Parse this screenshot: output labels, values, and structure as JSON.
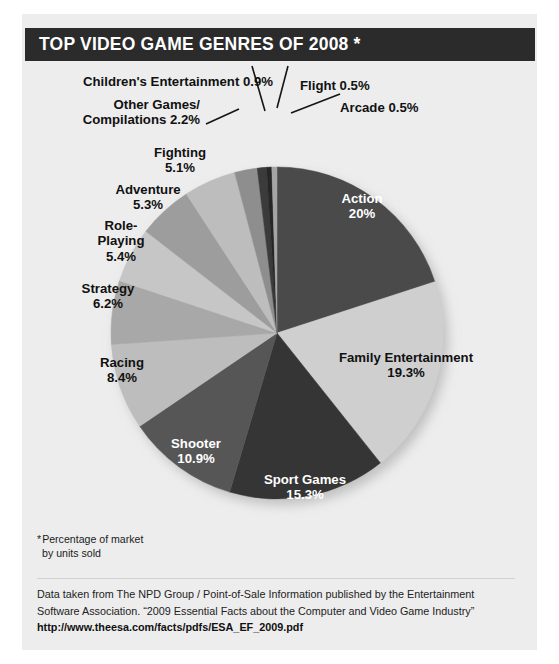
{
  "header": {
    "title": "TOP VIDEO GAME GENRES OF 2008 *"
  },
  "footnote": {
    "marker": "*",
    "line1": "Percentage of market",
    "line2": "by units sold"
  },
  "source": {
    "line1": "Data taken from The NPD Group / Point-of-Sale Information published by the Entertainment",
    "line2": "Software Association. “2009 Essential Facts about the Computer and Video Game Industry”",
    "url": "http://www.theesa.com/facts/pdfs/ESA_EF_2009.pdf"
  },
  "chart_data": {
    "type": "pie",
    "title": "TOP VIDEO GAME GENRES OF 2008 *",
    "unit": "percent of market by units sold",
    "categories": [
      "Action",
      "Family Entertainment",
      "Sport Games",
      "Shooter",
      "Racing",
      "Strategy",
      "Role-Playing",
      "Adventure",
      "Fighting",
      "Other Games/Compilations",
      "Children's Entertainment",
      "Flight",
      "Arcade"
    ],
    "values": [
      20,
      19.3,
      15.3,
      10.9,
      8.4,
      6.2,
      5.4,
      5.3,
      5.1,
      2.2,
      0.9,
      0.5,
      0.5
    ],
    "slices": [
      {
        "id": "action",
        "label": "Action",
        "value_text": "20%",
        "value": 20,
        "color": "#4a4a4a",
        "label_placement": "inside"
      },
      {
        "id": "family",
        "label": "Family Entertainment",
        "value_text": "19.3%",
        "value": 19.3,
        "color": "#cfcfcf",
        "label_placement": "outside-right"
      },
      {
        "id": "sport",
        "label": "Sport Games",
        "value_text": "15.3%",
        "value": 15.3,
        "color": "#353535",
        "label_placement": "inside"
      },
      {
        "id": "shooter",
        "label": "Shooter",
        "value_text": "10.9%",
        "value": 10.9,
        "color": "#565656",
        "label_placement": "inside"
      },
      {
        "id": "racing",
        "label": "Racing",
        "value_text": "8.4%",
        "value": 8.4,
        "color": "#bdbdbd",
        "label_placement": "outside-left"
      },
      {
        "id": "strategy",
        "label": "Strategy",
        "value_text": "6.2%",
        "value": 6.2,
        "color": "#a8a8a8",
        "label_placement": "outside-left"
      },
      {
        "id": "roleplaying",
        "label": "Role-Playing",
        "value_text": "5.4%",
        "value": 5.4,
        "color": "#c6c6c6",
        "label_placement": "outside-left"
      },
      {
        "id": "adventure",
        "label": "Adventure",
        "value_text": "5.3%",
        "value": 5.3,
        "color": "#9d9d9d",
        "label_placement": "outside-left"
      },
      {
        "id": "fighting",
        "label": "Fighting",
        "value_text": "5.1%",
        "value": 5.1,
        "color": "#bdbdbd",
        "label_placement": "outside-left"
      },
      {
        "id": "other",
        "label": "Other Games/ Compilations",
        "value_text": "2.2%",
        "value": 2.2,
        "color": "#8e8e8e",
        "label_placement": "leader-left"
      },
      {
        "id": "children",
        "label": "Children's Entertainment",
        "value_text": "0.9%",
        "value": 0.9,
        "color": "#3b3b3b",
        "label_placement": "leader-top"
      },
      {
        "id": "flight",
        "label": "Flight",
        "value_text": "0.5%",
        "value": 0.5,
        "color": "#262626",
        "label_placement": "leader-top"
      },
      {
        "id": "arcade",
        "label": "Arcade",
        "value_text": "0.5%",
        "value": 0.5,
        "color": "#a5a5a5",
        "label_placement": "leader-right"
      }
    ],
    "labels": {
      "children_entertainment": "Children's Entertainment 0.9%",
      "flight": "Flight 0.5%",
      "arcade": "Arcade 0.5%",
      "other_games_l1": "Other Games/",
      "other_games_l2": "Compilations 2.2%",
      "fighting_l1": "Fighting",
      "fighting_l2": "5.1%",
      "adventure_l1": "Adventure",
      "adventure_l2": "5.3%",
      "roleplaying_l1": "Role-",
      "roleplaying_l2": "Playing",
      "roleplaying_l3": "5.4%",
      "strategy_l1": "Strategy",
      "strategy_l2": "6.2%",
      "racing_l1": "Racing",
      "racing_l2": "8.4%",
      "shooter_l1": "Shooter",
      "shooter_l2": "10.9%",
      "sport_l1": "Sport Games",
      "sport_l2": "15.3%",
      "family_l1": "Family Entertainment",
      "family_l2": "19.3%",
      "action_l1": "Action",
      "action_l2": "20%"
    },
    "legend": "none",
    "grid": false,
    "start_angle_deg": -90,
    "direction": "clockwise"
  },
  "theme": {
    "header_bg": "#2b2b2b",
    "header_fg": "#ffffff",
    "page_bg": "#ededed",
    "text": "#111111"
  }
}
